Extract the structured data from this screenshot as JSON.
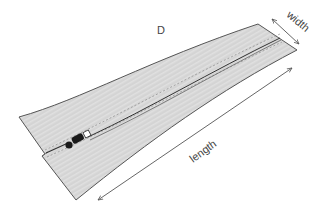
{
  "diagram": {
    "figure_label": "D",
    "labels": {
      "width": "width",
      "length": "length"
    },
    "colors": {
      "fabric": "#d4d4d4",
      "fabric_stripe": "#e2e2e2",
      "outline": "#555555",
      "stitch": "#8a8a8a",
      "slider": "#1a1a1a",
      "arrow": "#555555",
      "background": "#ffffff"
    }
  }
}
